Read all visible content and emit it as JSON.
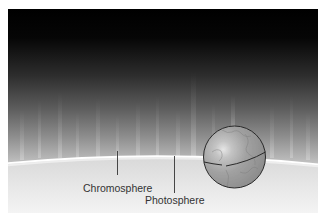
{
  "figure": {
    "labels": {
      "chromosphere": "Chromosphere",
      "photosphere": "Photosphere"
    },
    "earth": {
      "name": "Earth",
      "center": [
        234.5,
        157
      ],
      "radius": 31
    },
    "colors": {
      "space_top": "#000000",
      "chromosphere_mid": "#555555",
      "chromosphere_low": "#bdbdbd",
      "limb": "#ffffff",
      "photosphere_top": "#dcdcdc",
      "photosphere_bottom": "#f6f6f6",
      "text": "#333333",
      "leader_line": "#333333",
      "earth_fill": "#9a9a9a",
      "earth_outline": "#2a2a2a"
    },
    "spicules_x": [
      22,
      40,
      60,
      78,
      98,
      118,
      138,
      158,
      178,
      193,
      214,
      245,
      270,
      292,
      308
    ]
  }
}
